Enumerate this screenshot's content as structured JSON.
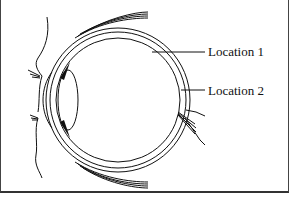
{
  "diagram": {
    "labels": [
      {
        "id": "location-1",
        "text": "Location 1"
      },
      {
        "id": "location-2",
        "text": "Location 2"
      }
    ],
    "colors": {
      "line": "#111111",
      "background": "#ffffff"
    }
  }
}
